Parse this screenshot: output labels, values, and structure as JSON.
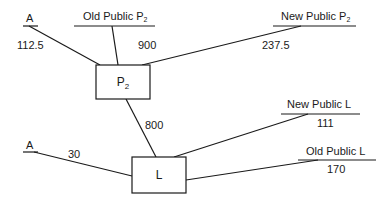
{
  "diagram": {
    "nodes": {
      "p2": {
        "label": "P",
        "sub": "2"
      },
      "l": {
        "label": "L"
      }
    },
    "terminals": {
      "a_top": {
        "label": "A",
        "value": "112.5"
      },
      "old_public_p2": {
        "label": "Old Public P",
        "sub": "2",
        "value": "900"
      },
      "new_public_p2": {
        "label": "New Public P",
        "sub": "2",
        "value": "237.5"
      },
      "a_bottom": {
        "label": "A",
        "value": "30"
      },
      "new_public_l": {
        "label": "New Public L",
        "value": "111"
      },
      "old_public_l": {
        "label": "Old Public L",
        "value": "170"
      }
    },
    "edges": [
      {
        "from": "p2",
        "to": "l",
        "value": "800"
      }
    ]
  }
}
